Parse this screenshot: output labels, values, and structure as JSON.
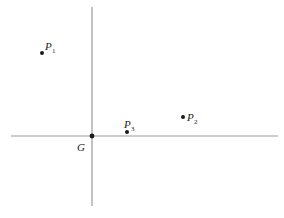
{
  "diagram": {
    "type": "points-on-axes",
    "colors": {
      "axis": "#9a9a9a",
      "point": "#1a1a1a",
      "text": "#222222"
    },
    "axes": {
      "horizontal": {
        "x1": 11,
        "x2": 278,
        "y": 136
      },
      "vertical": {
        "x": 92,
        "y1": 7,
        "y2": 206
      }
    },
    "origin": {
      "label": "G",
      "x": 92,
      "y": 136
    },
    "points": [
      {
        "id": "P1",
        "letter": "P",
        "sub": "1",
        "x": 42,
        "y": 53
      },
      {
        "id": "P2",
        "letter": "P",
        "sub": "2",
        "x": 183,
        "y": 117
      },
      {
        "id": "P3",
        "letter": "P",
        "sub": "3",
        "x": 127,
        "y": 132
      }
    ]
  }
}
